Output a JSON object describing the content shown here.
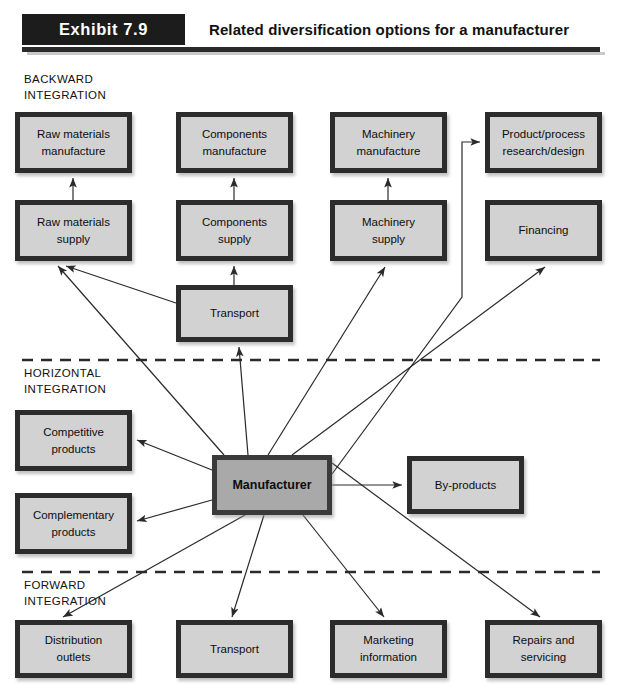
{
  "header": {
    "exhibit_label": "Exhibit 7.9",
    "title": "Related diversification options for a manufacturer"
  },
  "sections": [
    {
      "id": "backward",
      "caption": "BACKWARD\nINTEGRATION"
    },
    {
      "id": "horizontal",
      "caption": "HORIZONTAL\nINTEGRATION"
    },
    {
      "id": "forward",
      "caption": "FORWARD\nINTEGRATION"
    }
  ],
  "nodes": [
    {
      "id": "raw-materials-manufacture",
      "label": "Raw materials\nmanufacture",
      "x": 15,
      "y": 112,
      "w": 117,
      "h": 61,
      "kind": "normal"
    },
    {
      "id": "components-manufacture",
      "label": "Components\nmanufacture",
      "x": 176,
      "y": 112,
      "w": 117,
      "h": 61,
      "kind": "normal"
    },
    {
      "id": "machinery-manufacture",
      "label": "Machinery\nmanufacture",
      "x": 330,
      "y": 112,
      "w": 117,
      "h": 61,
      "kind": "normal"
    },
    {
      "id": "product-process-research",
      "label": "Product/process\nresearch/design",
      "x": 485,
      "y": 112,
      "w": 117,
      "h": 61,
      "kind": "normal"
    },
    {
      "id": "raw-materials-supply",
      "label": "Raw materials\nsupply",
      "x": 15,
      "y": 200,
      "w": 117,
      "h": 61,
      "kind": "normal"
    },
    {
      "id": "components-supply",
      "label": "Components\nsupply",
      "x": 176,
      "y": 200,
      "w": 117,
      "h": 61,
      "kind": "normal"
    },
    {
      "id": "machinery-supply",
      "label": "Machinery\nsupply",
      "x": 330,
      "y": 200,
      "w": 117,
      "h": 61,
      "kind": "normal"
    },
    {
      "id": "financing",
      "label": "Financing",
      "x": 485,
      "y": 200,
      "w": 117,
      "h": 61,
      "kind": "normal"
    },
    {
      "id": "transport-upper",
      "label": "Transport",
      "x": 176,
      "y": 285,
      "w": 117,
      "h": 57,
      "kind": "normal"
    },
    {
      "id": "competitive-products",
      "label": "Competitive\nproducts",
      "x": 15,
      "y": 410,
      "w": 117,
      "h": 61,
      "kind": "normal"
    },
    {
      "id": "complementary-products",
      "label": "Complementary\nproducts",
      "x": 15,
      "y": 493,
      "w": 117,
      "h": 61,
      "kind": "normal"
    },
    {
      "id": "manufacturer",
      "label": "Manufacturer",
      "x": 212,
      "y": 455,
      "w": 120,
      "h": 60,
      "kind": "primary"
    },
    {
      "id": "by-products",
      "label": "By-products",
      "x": 407,
      "y": 456,
      "w": 117,
      "h": 58,
      "kind": "normal"
    },
    {
      "id": "distribution-outlets",
      "label": "Distribution\noutlets",
      "x": 15,
      "y": 620,
      "w": 117,
      "h": 58,
      "kind": "normal"
    },
    {
      "id": "transport-lower",
      "label": "Transport",
      "x": 176,
      "y": 620,
      "w": 117,
      "h": 58,
      "kind": "normal"
    },
    {
      "id": "marketing-information",
      "label": "Marketing\ninformation",
      "x": 330,
      "y": 620,
      "w": 117,
      "h": 58,
      "kind": "normal"
    },
    {
      "id": "repairs-and-servicing",
      "label": "Repairs and\nservicing",
      "x": 485,
      "y": 620,
      "w": 117,
      "h": 58,
      "kind": "normal"
    }
  ],
  "divider_lines": [
    {
      "id": "backward-horizontal-divider",
      "y": 360
    },
    {
      "id": "horizontal-forward-divider",
      "y": 572
    }
  ],
  "connectors": [
    {
      "id": "arrow-raw-supply-to-raw-manufacture",
      "points": "73,200 73,178"
    },
    {
      "id": "arrow-components-supply-to-components-mfg",
      "points": "234,200 234,178"
    },
    {
      "id": "arrow-machinery-supply-to-machinery-mfg",
      "points": "388,200 388,178"
    },
    {
      "id": "arrow-transport-to-components-supply",
      "points": "234,285 234,266"
    },
    {
      "id": "arrow-transport-to-raw-materials-supply",
      "points": "176,303 66,266"
    },
    {
      "id": "arrow-manufacturer-to-transport-upper",
      "points": "248,455 239,347"
    },
    {
      "id": "arrow-manufacturer-to-raw-materials-supply",
      "points": "224,455 58,266"
    },
    {
      "id": "arrow-manufacturer-to-machinery-supply",
      "points": "268,455 385,267"
    },
    {
      "id": "arrow-manufacturer-to-financing",
      "points": "292,455 545,267"
    },
    {
      "id": "elbow-manufacturer-to-product-research",
      "points": "332,474 462,297 462,142 480,142"
    },
    {
      "id": "arrow-manufacturer-to-competitive",
      "points": "212,470 137,440"
    },
    {
      "id": "arrow-manufacturer-to-complementary",
      "points": "212,500 137,521"
    },
    {
      "id": "arrow-manufacturer-to-by-products",
      "points": "332,485 402,485"
    },
    {
      "id": "arrow-manufacturer-to-distribution",
      "points": "245,515 63,617"
    },
    {
      "id": "arrow-manufacturer-to-transport-lower",
      "points": "264,515 232,617"
    },
    {
      "id": "arrow-manufacturer-to-marketing",
      "points": "303,515 384,617"
    },
    {
      "id": "arrow-manufacturer-to-repairs",
      "points": "332,463 540,617"
    }
  ],
  "colors": {
    "header_bar": "#1c1c1c",
    "box_border": "#2c2c2c",
    "box_fill": "#d2d2d2",
    "primary_fill": "#a9a9a9",
    "connector": "#2a2a2a"
  }
}
